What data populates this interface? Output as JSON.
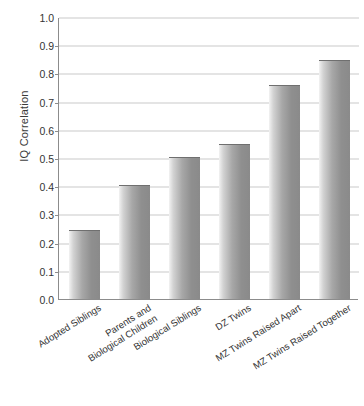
{
  "chart_data": {
    "type": "bar",
    "title": "",
    "subtitle": "",
    "xlabel": "",
    "ylabel": "IQ Correlation",
    "ylim": [
      0.0,
      1.0
    ],
    "grid": true,
    "legend": "none",
    "orientation": "vertical",
    "categories": [
      "Adopted Siblings",
      "Parents and\nBiological Children",
      "Biological Siblings",
      "DZ Twins",
      "MZ Twins Raised Apart",
      "MZ Twins Raised Together"
    ],
    "values": [
      0.24,
      0.4,
      0.5,
      0.545,
      0.755,
      0.845
    ],
    "ytick_labels": [
      "1.0",
      "0.9",
      "0.8",
      "0.7",
      "0.6",
      "0.5",
      "0.4",
      "0.3",
      "0.2",
      "0.1",
      "0.0"
    ],
    "ytick_values": [
      1.0,
      0.9,
      0.8,
      0.7,
      0.6,
      0.5,
      0.4,
      0.3,
      0.2,
      0.1,
      0.0
    ],
    "colors": {
      "bar_light": "#f2f2f2",
      "bar_dark": "#8a8a8a",
      "gridline": "#c9c9c9",
      "axis": "#8c8c8c",
      "text": "#333333",
      "background": "#ffffff"
    }
  }
}
